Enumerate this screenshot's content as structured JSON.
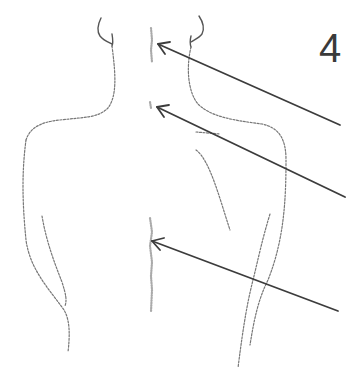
{
  "figure": {
    "number_label": "4",
    "arrows": [
      {
        "name": "upper-neck-arrow",
        "target": "cervical spine (neck)",
        "from": [
          340,
          125
        ],
        "to": [
          158,
          44
        ]
      },
      {
        "name": "upper-back-arrow",
        "target": "upper thoracic spine",
        "from": [
          345,
          197
        ],
        "to": [
          157,
          107
        ]
      },
      {
        "name": "mid-back-arrow",
        "target": "mid/lower thoracic spine",
        "from": [
          338,
          311
        ],
        "to": [
          152,
          241
        ]
      }
    ],
    "colors": {
      "arrow": "#3c3c3c",
      "outline": "#777777",
      "number": "#3a3a3a",
      "background": "#ffffff"
    }
  }
}
